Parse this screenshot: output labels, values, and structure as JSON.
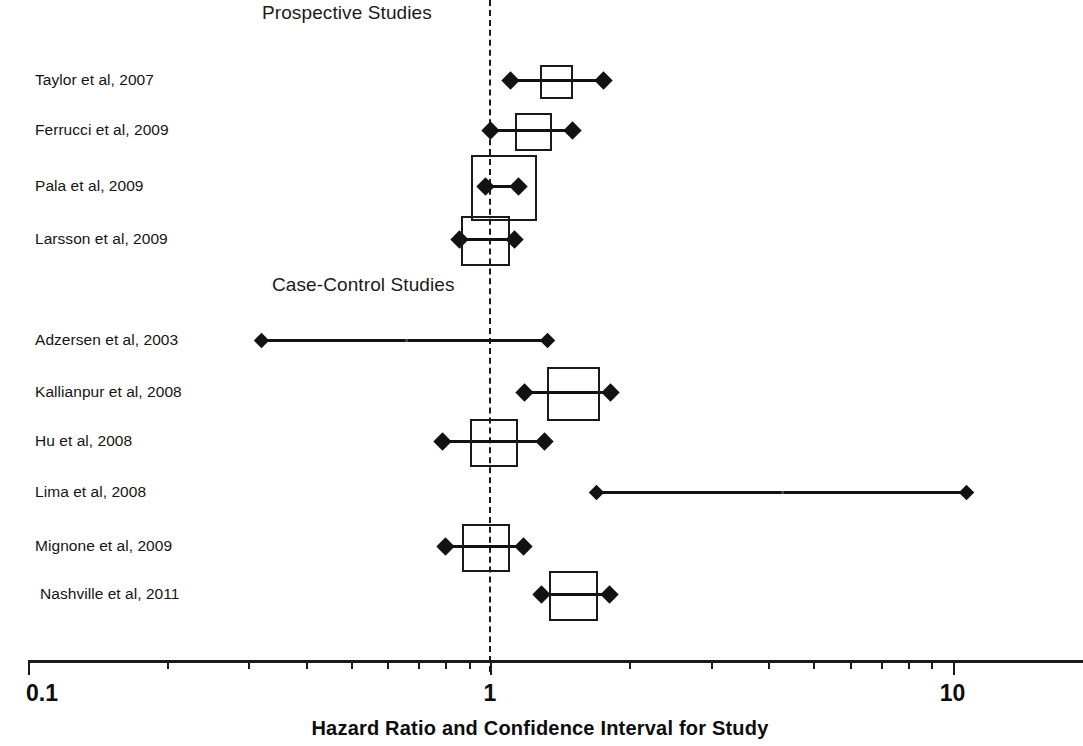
{
  "figure": {
    "type": "forest-plot",
    "axis_title": "Hazard Ratio and Confidence Interval for Study",
    "reference_value": 1
  },
  "sections": [
    {
      "id": "prospective",
      "label": "Prospective Studies"
    },
    {
      "id": "case-control",
      "label": "Case-Control Studies"
    }
  ],
  "axis": {
    "scale": "log10",
    "min": 0.1,
    "max": 22,
    "tick_labels": [
      "0.1",
      "1",
      "10"
    ],
    "tick_label_values": [
      0.1,
      1,
      10
    ],
    "minor_ticks": [
      0.2,
      0.3,
      0.4,
      0.5,
      0.6,
      0.7,
      0.8,
      0.9,
      2,
      3,
      4,
      5,
      6,
      7,
      8,
      9,
      20
    ],
    "major_ticks": [
      0.1,
      1,
      10
    ]
  },
  "chart_data": {
    "type": "forest",
    "title": "",
    "xlabel": "Hazard Ratio and Confidence Interval for Study",
    "ylabel": "",
    "xscale": "log",
    "xlim": [
      0.1,
      22
    ],
    "xticks": [
      0.1,
      1,
      10
    ],
    "xticklabels": [
      "0.1",
      "1",
      "10"
    ],
    "reference_line": 1,
    "grid": false,
    "legend": "none",
    "groups": [
      {
        "name": "Prospective Studies",
        "studies": [
          {
            "label": "Taylor et al, 2007",
            "estimate": 1.38,
            "ci_low": 1.11,
            "ci_high": 1.76,
            "weight": 0.1
          },
          {
            "label": "Ferrucci et al, 2009",
            "estimate": 1.23,
            "ci_low": 1.0,
            "ci_high": 1.51,
            "weight": 0.16
          },
          {
            "label": "Pala et al, 2009",
            "estimate": 1.06,
            "ci_low": 0.98,
            "ci_high": 1.15,
            "weight": 1.0
          },
          {
            "label": "Larsson et al, 2009",
            "estimate": 0.97,
            "ci_low": 0.86,
            "ci_high": 1.13,
            "weight": 0.42
          }
        ]
      },
      {
        "name": "Case-Control Studies",
        "studies": [
          {
            "label": "Adzersen et al, 2003",
            "estimate": 0.66,
            "ci_low": 0.32,
            "ci_high": 1.33,
            "weight": 0.02
          },
          {
            "label": "Kallianpur et al, 2008",
            "estimate": 1.5,
            "ci_low": 1.19,
            "ci_high": 1.82,
            "weight": 0.55
          },
          {
            "label": "Hu et al, 2008",
            "estimate": 1.01,
            "ci_low": 0.79,
            "ci_high": 1.31,
            "weight": 0.38
          },
          {
            "label": "Lima et al, 2008",
            "estimate": 4.3,
            "ci_low": 1.7,
            "ci_high": 10.7,
            "weight": 0.02
          },
          {
            "label": "Mignone et al, 2009",
            "estimate": 0.97,
            "ci_low": 0.8,
            "ci_high": 1.18,
            "weight": 0.38
          },
          {
            "label": "Nashville et al, 2011",
            "estimate": 1.5,
            "ci_low": 1.29,
            "ci_high": 1.81,
            "weight": 0.43
          }
        ]
      }
    ]
  },
  "layout": {
    "rows": [
      {
        "key": "taylor",
        "y": 80,
        "label_x": 35,
        "group": 0,
        "index": 0
      },
      {
        "key": "ferrucci",
        "y": 130,
        "label_x": 35,
        "group": 0,
        "index": 1
      },
      {
        "key": "pala",
        "y": 186,
        "label_x": 35,
        "group": 0,
        "index": 2
      },
      {
        "key": "larsson",
        "y": 239,
        "label_x": 35,
        "group": 0,
        "index": 3
      },
      {
        "key": "adzersen",
        "y": 340,
        "label_x": 35,
        "group": 1,
        "index": 0
      },
      {
        "key": "kallianpur",
        "y": 392,
        "label_x": 35,
        "group": 1,
        "index": 1
      },
      {
        "key": "hu",
        "y": 441,
        "label_x": 35,
        "group": 1,
        "index": 2
      },
      {
        "key": "lima",
        "y": 492,
        "label_x": 35,
        "group": 1,
        "index": 3
      },
      {
        "key": "mignone",
        "y": 546,
        "label_x": 35,
        "group": 1,
        "index": 4
      },
      {
        "key": "nashville",
        "y": 594,
        "label_x": 40,
        "group": 1,
        "index": 5
      }
    ],
    "section_headers": [
      {
        "id": "prospective",
        "x": 262,
        "y": 2
      },
      {
        "id": "case-control",
        "x": 272,
        "y": 274
      }
    ],
    "axis_y": 660,
    "axis_left": 28,
    "axis_right": 1083,
    "px_per_decade": 462.5,
    "x_at_one": 490,
    "ref_line_top": 0,
    "ref_line_bottom": 672
  },
  "colors": {
    "ink": "#121212",
    "background": "#ffffff"
  }
}
